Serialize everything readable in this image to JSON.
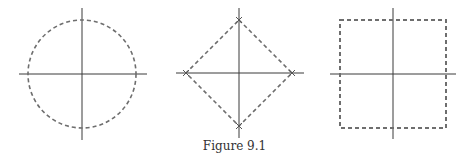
{
  "caption": "Figure 9.1",
  "figures": [
    {
      "name": "circle",
      "shape": "circle",
      "cx": 82,
      "cy": 74,
      "r": 54
    },
    {
      "name": "diamond",
      "shape": "diamond",
      "cx": 239,
      "cy": 73,
      "half": 53
    },
    {
      "name": "square",
      "shape": "square",
      "cx": 393,
      "cy": 74,
      "half_w": 53,
      "half_h": 54
    }
  ],
  "colors": {
    "axis": "#3a3a3a",
    "dashed": "#6e6e6e"
  }
}
